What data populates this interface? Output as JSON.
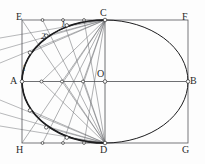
{
  "figure": {
    "type": "geometry-diagram",
    "canvas": {
      "width": 205,
      "height": 164
    },
    "colors": {
      "background": "#fdfdfd",
      "rectangle_stroke": "#55565a",
      "ellipse_stroke": "#1d1d1f",
      "construction_stroke": "#6e6f73",
      "axis_stroke": "#4a4b4f",
      "point_fill": "#ffffff",
      "point_stroke": "#2b2b2b",
      "label_color": "#2b2b2b"
    },
    "rectangle": {
      "left": 22,
      "top": 20,
      "right": 188,
      "bottom": 143,
      "corners": [
        {
          "id": "E",
          "label": "E",
          "x": 22,
          "y": 20
        },
        {
          "id": "F",
          "label": "F",
          "x": 188,
          "y": 20
        },
        {
          "id": "G",
          "label": "G",
          "x": 188,
          "y": 143
        },
        {
          "id": "H",
          "label": "H",
          "x": 22,
          "y": 143
        }
      ]
    },
    "ellipse": {
      "center_x": 105,
      "center_y": 81.5,
      "radius_x": 83,
      "radius_y": 61.5
    },
    "axis_points": [
      {
        "id": "A",
        "label": "A",
        "x": 22,
        "y": 81.5,
        "desc": "left vertex of major axis"
      },
      {
        "id": "B",
        "label": "B",
        "x": 188,
        "y": 81.5,
        "desc": "right vertex of major axis"
      },
      {
        "id": "C",
        "label": "C",
        "x": 105,
        "y": 20,
        "desc": "top vertex of minor axis"
      },
      {
        "id": "D",
        "label": "D",
        "x": 105,
        "y": 143,
        "desc": "bottom vertex of minor axis"
      },
      {
        "id": "O",
        "label": "O",
        "x": 105,
        "y": 81.5,
        "desc": "center"
      }
    ],
    "corner_labels": [
      {
        "text": "E",
        "x": 16,
        "y": 12
      },
      {
        "text": "F",
        "x": 182,
        "y": 12
      },
      {
        "text": "H",
        "x": 16,
        "y": 145
      },
      {
        "text": "G",
        "x": 182,
        "y": 145
      },
      {
        "text": "A",
        "x": 10,
        "y": 76
      },
      {
        "text": "B",
        "x": 190,
        "y": 76
      },
      {
        "text": "C",
        "x": 100,
        "y": 8
      },
      {
        "text": "D",
        "x": 100,
        "y": 145
      },
      {
        "text": "O",
        "x": 97,
        "y": 69
      }
    ],
    "division_labels": [
      {
        "text": "1",
        "x": 61,
        "y": 21
      },
      {
        "text": "2",
        "x": 41,
        "y": 33
      },
      {
        "text": "1",
        "x": 22,
        "y": 65
      }
    ],
    "top_division_points": [
      {
        "x": 22,
        "y": 20
      },
      {
        "x": 42.5,
        "y": 20
      },
      {
        "x": 63,
        "y": 20
      },
      {
        "x": 84,
        "y": 20
      }
    ],
    "axis_division_points": [
      {
        "x": 41.5,
        "y": 81.5
      },
      {
        "x": 62,
        "y": 81.5
      },
      {
        "x": 83,
        "y": 81.5
      }
    ],
    "bottom_division_points": [
      {
        "x": 22,
        "y": 143
      },
      {
        "x": 42.5,
        "y": 143
      },
      {
        "x": 63,
        "y": 143
      },
      {
        "x": 84,
        "y": 143
      }
    ],
    "arc_points_upper": [
      {
        "x": 66.8,
        "y": 25.3
      },
      {
        "x": 46.2,
        "y": 35.6
      },
      {
        "x": 29.9,
        "y": 52.6
      }
    ],
    "arc_points_lower": [
      {
        "x": 29.9,
        "y": 110.4
      },
      {
        "x": 46.2,
        "y": 127.4
      },
      {
        "x": 66.8,
        "y": 137.7
      }
    ],
    "lines_from_D": [
      {
        "to_x": 22,
        "to_y": 20
      },
      {
        "to_x": 42.5,
        "to_y": 20
      },
      {
        "to_x": 63,
        "to_y": 20
      },
      {
        "to_x": 84,
        "to_y": 20
      }
    ],
    "lines_from_C": [
      {
        "to_x": 22,
        "to_y": 143
      },
      {
        "to_x": 42.5,
        "to_y": 143
      },
      {
        "to_x": 63,
        "to_y": 143
      },
      {
        "to_x": 84,
        "to_y": 143
      }
    ],
    "lines_from_C_to_axis": [
      {
        "to_x": 41.5,
        "to_y": 81.5
      },
      {
        "to_x": 62,
        "to_y": 81.5
      },
      {
        "to_x": 83,
        "to_y": 81.5
      }
    ],
    "lines_from_D_to_axis": [
      {
        "to_x": 41.5,
        "to_y": 81.5
      },
      {
        "to_x": 62,
        "to_y": 81.5
      },
      {
        "to_x": 83,
        "to_y": 81.5
      }
    ],
    "outside_rays_upper": [
      {
        "x1": 0,
        "y1": 38,
        "x2": 105,
        "y2": 20
      },
      {
        "x1": 0,
        "y1": 50,
        "x2": 105,
        "y2": 20
      },
      {
        "x1": 0,
        "y1": 63,
        "x2": 105,
        "y2": 20
      }
    ],
    "outside_rays_lower": [
      {
        "x1": 0,
        "y1": 100,
        "x2": 105,
        "y2": 143
      },
      {
        "x1": 0,
        "y1": 113,
        "x2": 105,
        "y2": 143
      },
      {
        "x1": 0,
        "y1": 126,
        "x2": 105,
        "y2": 143
      }
    ]
  }
}
